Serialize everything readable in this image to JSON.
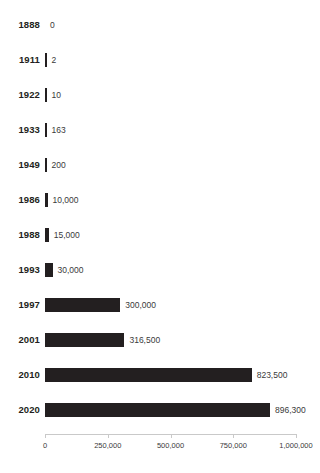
{
  "chart_data": {
    "type": "bar",
    "orientation": "horizontal",
    "title": "",
    "subtitle": "",
    "xlabel": "",
    "ylabel": "",
    "categories": [
      "1888",
      "1911",
      "1922",
      "1933",
      "1949",
      "1986",
      "1988",
      "1993",
      "1997",
      "2001",
      "2010",
      "2020"
    ],
    "values": [
      0,
      2,
      10,
      163,
      200,
      10000,
      15000,
      30000,
      300000,
      316500,
      823500,
      896300
    ],
    "value_labels": [
      "0",
      "2",
      "10",
      "163",
      "200",
      "10,000",
      "15,000",
      "30,000",
      "300,000",
      "316,500",
      "823,500",
      "896,300"
    ],
    "xlim": [
      0,
      1000000
    ],
    "xticks": [
      0,
      250000,
      500000,
      750000,
      1000000
    ],
    "xtick_labels": [
      "0",
      "250,000",
      "500,000",
      "750,000",
      "1,000,000"
    ],
    "grid": false,
    "legend": false,
    "bar_color": "#231f20",
    "background_color": "#ffffff",
    "label_color": "#3a3a3a"
  }
}
